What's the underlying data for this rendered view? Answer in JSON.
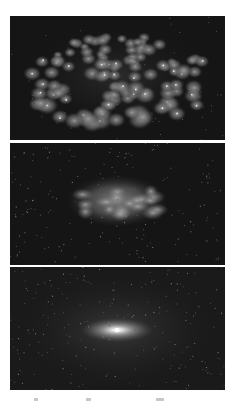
{
  "figure": {
    "panels": [
      {
        "id": "panel-1",
        "description": "Early stage: many separate clumps/blobs arranged in an ellipse, each with bright cores",
        "background": "#151515"
      },
      {
        "id": "panel-2",
        "description": "Intermediate stage: clumps merging into a diffuse lumpy elliptical cloud",
        "background": "#151515"
      },
      {
        "id": "panel-3",
        "description": "Late stage: smooth elliptical system with a bright central core",
        "background": "#1a1a1a"
      }
    ],
    "separator_color": "#f2f2f2",
    "caption_marks": [
      "",
      "",
      ""
    ]
  }
}
